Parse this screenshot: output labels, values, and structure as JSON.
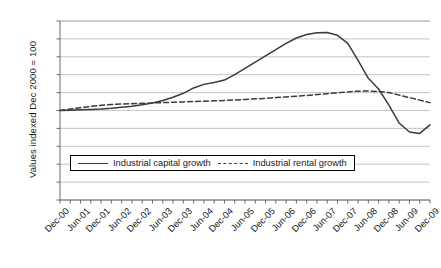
{
  "chart_data": {
    "type": "line",
    "title": "",
    "xlabel": "",
    "ylabel": "Values indexed Dec 2000 = 100",
    "ylim": [
      50.0,
      150.0
    ],
    "ytick_step": 10.0,
    "grid": true,
    "legend_position": "inside-bottom-center",
    "x_tick_labels": [
      "Dec-00",
      "Jun-01",
      "Dec-01",
      "Jun-02",
      "Dec-02",
      "Jun-03",
      "Dec-03",
      "Jun-04",
      "Dec-04",
      "Jun-05",
      "Dec-05",
      "Jun-06",
      "Dec-06",
      "Jun-07",
      "Dec-07",
      "Jun-08",
      "Dec-08",
      "Jun-09",
      "Dec-09"
    ],
    "y_tick_labels": [
      "150.0",
      "140.0",
      "130.0",
      "120.0",
      "110.0",
      "100.0",
      "90.0",
      "80.0",
      "70.0",
      "60.0",
      "50.0"
    ],
    "x": [
      "Dec-00",
      "Mar-01",
      "Jun-01",
      "Sep-01",
      "Dec-01",
      "Mar-02",
      "Jun-02",
      "Sep-02",
      "Dec-02",
      "Mar-03",
      "Jun-03",
      "Sep-03",
      "Dec-03",
      "Mar-04",
      "Jun-04",
      "Sep-04",
      "Dec-04",
      "Mar-05",
      "Jun-05",
      "Sep-05",
      "Dec-05",
      "Mar-06",
      "Jun-06",
      "Sep-06",
      "Dec-06",
      "Mar-07",
      "Jun-07",
      "Sep-07",
      "Dec-07",
      "Mar-08",
      "Jun-08",
      "Sep-08",
      "Dec-08",
      "Mar-09",
      "Jun-09",
      "Sep-09",
      "Dec-09"
    ],
    "series": [
      {
        "name": "Industrial capital growth",
        "style": "solid",
        "color": "#3b3b3b",
        "values": [
          100.0,
          100.2,
          100.4,
          100.6,
          100.8,
          101.2,
          101.8,
          102.4,
          103.2,
          104.2,
          105.6,
          107.4,
          109.6,
          112.6,
          114.6,
          115.6,
          117.0,
          120.0,
          123.5,
          127.0,
          130.5,
          134.0,
          137.5,
          140.5,
          142.5,
          143.4,
          143.6,
          142.0,
          137.5,
          128.0,
          118.0,
          112.0,
          103.0,
          93.0,
          88.0,
          87.2,
          92.0
        ]
      },
      {
        "name": "Industrial rental growth",
        "style": "dashed",
        "color": "#3b3b3b",
        "values": [
          100.0,
          100.8,
          101.6,
          102.3,
          102.9,
          103.3,
          103.6,
          103.8,
          104.0,
          104.2,
          104.4,
          104.6,
          104.8,
          105.0,
          105.2,
          105.4,
          105.6,
          105.9,
          106.2,
          106.5,
          106.8,
          107.2,
          107.6,
          108.0,
          108.4,
          108.9,
          109.4,
          109.9,
          110.4,
          110.8,
          110.9,
          110.6,
          110.0,
          108.6,
          107.2,
          105.8,
          104.4
        ]
      }
    ],
    "legend": [
      {
        "label": "Industrial capital growth",
        "key": "solid-line-key"
      },
      {
        "label": "Industrial rental growth",
        "key": "dashed-line-key"
      }
    ]
  }
}
